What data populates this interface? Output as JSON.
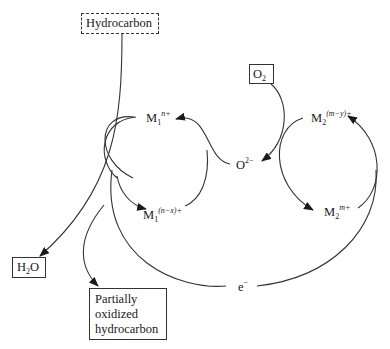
{
  "diagram": {
    "nodes": {
      "hydrocarbon": {
        "label": "Hydrocarbon",
        "style": "dashed-box"
      },
      "o2": {
        "base": "O",
        "sub": "2",
        "style": "box"
      },
      "h2o": {
        "base": "H",
        "sub": "2",
        "tail": "O",
        "style": "box"
      },
      "partial": {
        "lines": [
          "Partially",
          "oxidized",
          "hydrocarbon"
        ],
        "style": "box"
      },
      "m1_high": {
        "base": "M",
        "sub": "1",
        "sup": "n+"
      },
      "m1_low": {
        "base": "M",
        "sub": "1",
        "sup": "(n−x)+"
      },
      "m2_low": {
        "base": "M",
        "sub": "2",
        "sup": "(m−y)+"
      },
      "m2_high": {
        "base": "M",
        "sub": "2",
        "sup": "m+"
      },
      "oxide": {
        "base": "O",
        "sup": "2−"
      },
      "electron": {
        "base": "e",
        "sup": "−"
      }
    },
    "edges": [
      {
        "from": "hydrocarbon",
        "to": "h2o"
      },
      {
        "from": "hydrocarbon",
        "to": "partial"
      },
      {
        "from": "m1_high",
        "to": "m1_low"
      },
      {
        "from": "oxide",
        "to": "m1_high"
      },
      {
        "from": "o2",
        "to": "oxide"
      },
      {
        "from": "m2_low",
        "to": "m2_high"
      },
      {
        "from": "electron",
        "to": "m2_low"
      }
    ],
    "colors": {
      "line": "#333333",
      "background": "#ffffff"
    }
  }
}
